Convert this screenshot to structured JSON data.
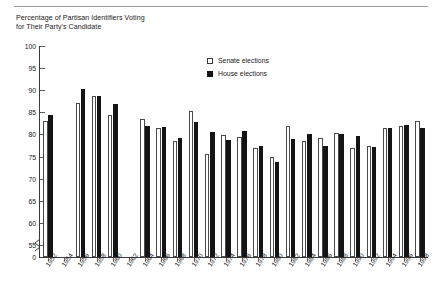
{
  "chart_data": {
    "type": "bar",
    "title": "Percentage of Partisan Identifiers Voting for Their Party's Candidate",
    "title_lines": [
      "Percentage of Partisan Identifiers Voting",
      "for Their Party's Candidate"
    ],
    "xlabel": "",
    "ylabel": "",
    "ylim": [
      55,
      100
    ],
    "y_axis_break": true,
    "y_ticks": [
      "0",
      "55",
      "60",
      "65",
      "70",
      "75",
      "80",
      "85",
      "90",
      "95",
      "100"
    ],
    "y_tick_values": [
      0,
      55,
      60,
      65,
      70,
      75,
      80,
      85,
      90,
      95,
      100
    ],
    "grid": false,
    "legend_position": "top-center-right",
    "categories": [
      "1952",
      "1954",
      "1956",
      "1958",
      "1960",
      "1962",
      "1964",
      "1966",
      "1968",
      "1970",
      "1972",
      "1974",
      "1976",
      "1978",
      "1980",
      "1982",
      "1984",
      "1986",
      "1988",
      "1990",
      "1992",
      "1994",
      "1996",
      "1998"
    ],
    "series": [
      {
        "name": "Senate elections",
        "style": "open",
        "values": [
          83.0,
          null,
          87.2,
          88.7,
          84.3,
          null,
          83.4,
          81.5,
          78.5,
          85.3,
          75.5,
          79.8,
          79.5,
          77.0,
          75.0,
          81.8,
          78.5,
          79.3,
          80.3,
          77.0,
          77.3,
          81.5,
          82.0,
          83.0
        ]
      },
      {
        "name": "House elections",
        "style": "filled",
        "values": [
          84.4,
          null,
          90.2,
          88.8,
          86.9,
          null,
          81.9,
          81.6,
          79.1,
          82.9,
          80.5,
          78.8,
          80.7,
          77.5,
          73.7,
          79.0,
          80.0,
          77.5,
          80.0,
          79.6,
          77.2,
          81.5,
          82.2,
          81.5
        ]
      }
    ]
  },
  "legend": {
    "items": [
      {
        "label": "Senate elections",
        "style": "open"
      },
      {
        "label": "House elections",
        "style": "filled"
      }
    ]
  },
  "colors": {
    "senate_fill": "#ffffff",
    "senate_border": "#4a4a4a",
    "house_fill": "#141414",
    "axis": "#3a3a3a",
    "text": "#1a1a1a",
    "rule": "#9a9a9a"
  }
}
